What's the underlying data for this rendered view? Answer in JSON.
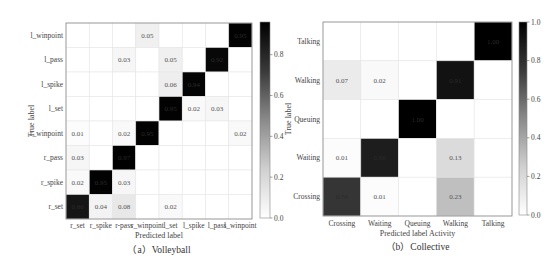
{
  "chart_data": [
    {
      "type": "heatmap",
      "title": "",
      "caption": "（a）Volleyball",
      "xlabel": "Predicted label",
      "ylabel": "True label",
      "row_labels": [
        "l_winpoint",
        "l_pass",
        "l_spike",
        "l_set",
        "r_winpoint",
        "r_pass",
        "r_spike",
        "r_set"
      ],
      "col_labels": [
        "r_set",
        "r_spike",
        "r-pass",
        "r_winpoint",
        "l_set",
        "l_spike",
        "l_pass",
        "l_winpoint"
      ],
      "values": [
        [
          null,
          null,
          null,
          0.05,
          null,
          null,
          null,
          0.95
        ],
        [
          null,
          null,
          0.03,
          null,
          0.05,
          null,
          0.92,
          null
        ],
        [
          null,
          null,
          null,
          null,
          0.06,
          0.94,
          null,
          null
        ],
        [
          null,
          null,
          null,
          null,
          0.95,
          0.02,
          0.03,
          null
        ],
        [
          0.01,
          null,
          0.02,
          0.95,
          null,
          null,
          null,
          0.02
        ],
        [
          0.03,
          null,
          0.97,
          null,
          null,
          null,
          null,
          null
        ],
        [
          0.02,
          0.95,
          0.03,
          null,
          null,
          null,
          null,
          null
        ],
        [
          0.86,
          0.04,
          0.08,
          null,
          0.02,
          null,
          null,
          null
        ]
      ],
      "colorbar": {
        "ticks": [
          0.0,
          0.2,
          0.4,
          0.6,
          0.8
        ],
        "range": [
          0.0,
          0.96
        ],
        "colormap": "Greys"
      }
    },
    {
      "type": "heatmap",
      "title": "",
      "caption": "（b）Collective",
      "xlabel": "Predicted label Activity",
      "ylabel": "True label",
      "row_labels": [
        "Talking",
        "Walking",
        "Queuing",
        "Waiting",
        "Crossing"
      ],
      "col_labels": [
        "Crossing",
        "Waiting",
        "Queuing",
        "Walking",
        "Talking"
      ],
      "values": [
        [
          null,
          null,
          null,
          null,
          1.0
        ],
        [
          0.07,
          0.02,
          null,
          0.91,
          null
        ],
        [
          null,
          null,
          1.0,
          null,
          null
        ],
        [
          0.01,
          0.86,
          null,
          0.13,
          null
        ],
        [
          0.76,
          0.01,
          null,
          0.23,
          null
        ]
      ],
      "colorbar": {
        "ticks": [
          0.0,
          0.2,
          0.4,
          0.6,
          0.8,
          1.0
        ],
        "range": [
          0.0,
          1.0
        ],
        "colormap": "Greys"
      }
    }
  ]
}
